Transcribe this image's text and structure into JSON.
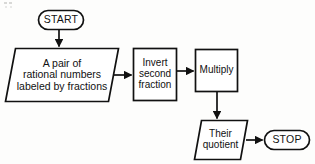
{
  "figure": {
    "type": "flowchart",
    "orientation": "left-to-right then down",
    "line_color": "#111111",
    "background_color": "#fdfdfc"
  },
  "nodes": {
    "start": {
      "id": "start",
      "shape": "terminator",
      "label": "START"
    },
    "input_pair": {
      "shape": "parallelogram",
      "role": "input",
      "line1": "A pair of",
      "line2": "rational numbers",
      "line3": "labeled by fractions"
    },
    "invert": {
      "shape": "rectangle",
      "role": "process",
      "line1": "Invert",
      "line2": "second",
      "line3": "fraction"
    },
    "multiply": {
      "shape": "rectangle",
      "role": "process",
      "line1": "Multiply"
    },
    "quotient": {
      "shape": "parallelogram",
      "role": "output",
      "line1": "Their",
      "line2": "quotient"
    },
    "stop": {
      "id": "stop",
      "shape": "terminator",
      "label": "STOP"
    }
  },
  "edges": [
    {
      "from": "start",
      "to": "input_pair",
      "direction": "down",
      "arrowhead": true
    },
    {
      "from": "input_pair",
      "to": "invert",
      "direction": "right",
      "arrowhead": true
    },
    {
      "from": "invert",
      "to": "multiply",
      "direction": "right",
      "arrowhead": true
    },
    {
      "from": "multiply",
      "to": "quotient",
      "direction": "down",
      "arrowhead": true
    },
    {
      "from": "quotient",
      "to": "stop",
      "direction": "right",
      "arrowhead": true
    }
  ]
}
